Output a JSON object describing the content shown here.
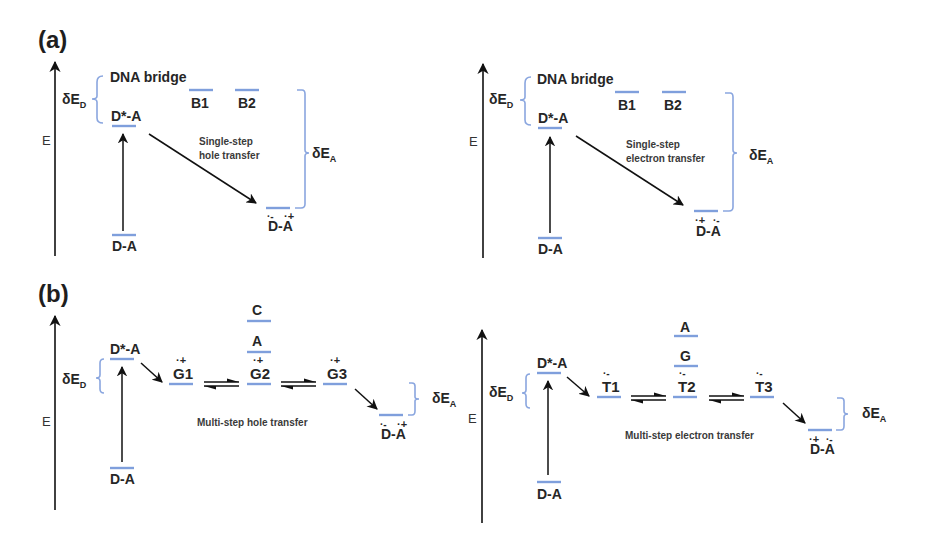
{
  "figure": {
    "panel_a": {
      "label": "(a)",
      "hole": {
        "axis_label": "E",
        "bridge_label": "DNA bridge",
        "delta_ed": "δE",
        "delta_ed_sub": "D",
        "delta_ea": "δE",
        "delta_ea_sub": "A",
        "excited": "D*-A",
        "ground": "D-A",
        "b1": "B1",
        "b2": "B2",
        "product": "D-A",
        "product_d_charge": "·-",
        "product_a_charge": "·+",
        "process_line1": "Single-step",
        "process_line2": "hole transfer"
      },
      "electron": {
        "axis_label": "E",
        "bridge_label": "DNA bridge",
        "delta_ed": "δE",
        "delta_ed_sub": "D",
        "delta_ea": "δE",
        "delta_ea_sub": "A",
        "excited": "D*-A",
        "ground": "D-A",
        "b1": "B1",
        "b2": "B2",
        "product": "D-A",
        "product_d_charge": "·+",
        "product_a_charge": "·-",
        "process_line1": "Single-step",
        "process_line2": "electron transfer"
      }
    },
    "panel_b": {
      "label": "(b)",
      "hole": {
        "axis_label": "E",
        "delta_ed": "δE",
        "delta_ed_sub": "D",
        "delta_ea": "δE",
        "delta_ea_sub": "A",
        "excited": "D*-A",
        "ground": "D-A",
        "sites": [
          "G1",
          "G2",
          "G3"
        ],
        "site_charge": "·+",
        "upper_levels": [
          "C",
          "A"
        ],
        "product": "D-A",
        "product_d_charge": "·-",
        "product_a_charge": "·+",
        "process": "Multi-step hole transfer"
      },
      "electron": {
        "axis_label": "E",
        "delta_ed": "δE",
        "delta_ed_sub": "D",
        "delta_ea": "δE",
        "delta_ea_sub": "A",
        "excited": "D*-A",
        "ground": "D-A",
        "sites": [
          "T1",
          "T2",
          "T3"
        ],
        "site_charge": "·-",
        "upper_levels": [
          "A",
          "G"
        ],
        "product": "D-A",
        "product_d_charge": "·+",
        "product_a_charge": "·-",
        "process": "Multi-step electron transfer"
      }
    },
    "colors": {
      "energy_level": "#7f9fdc",
      "bracket": "#8aa6df",
      "text": "#262626",
      "arrow": "#111111"
    }
  }
}
